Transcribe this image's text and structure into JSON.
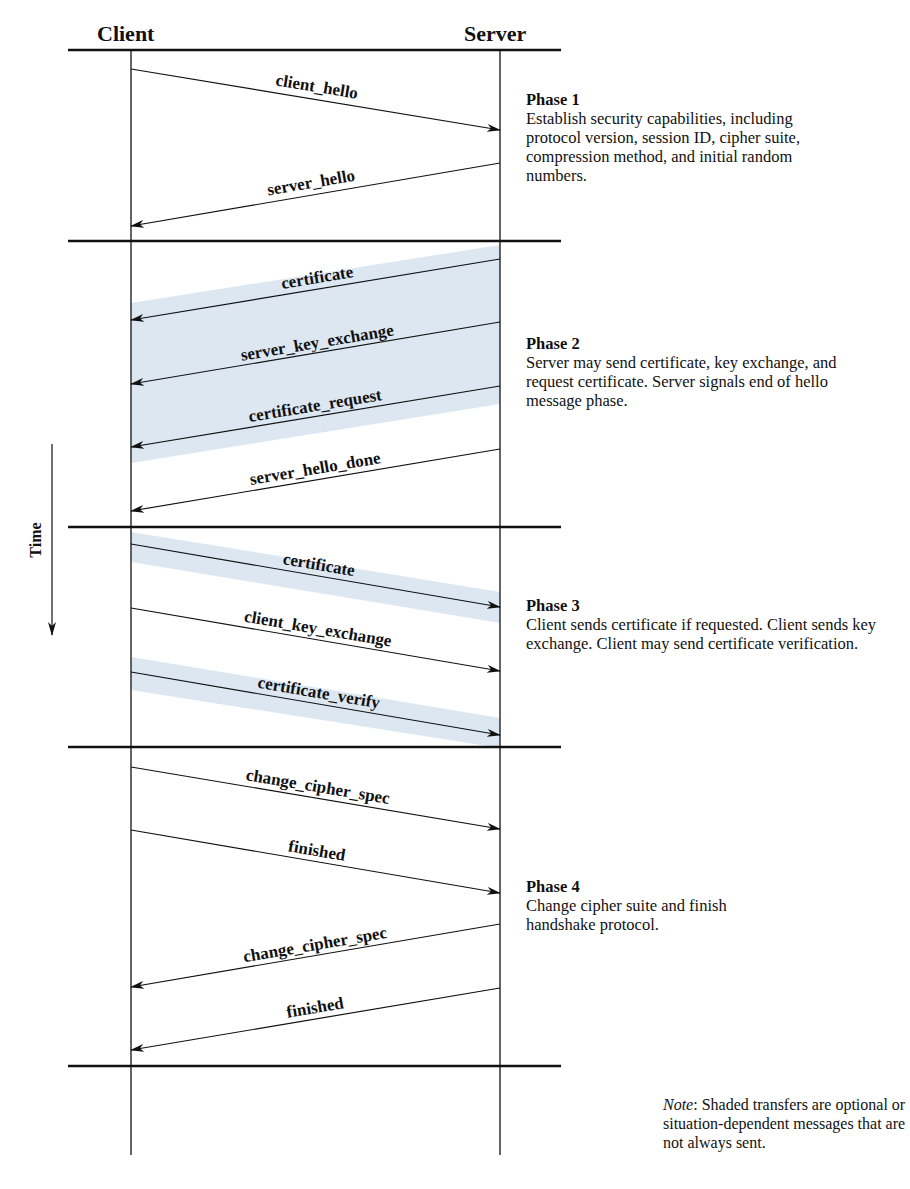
{
  "diagram": {
    "parties": {
      "client": "Client",
      "server": "Server"
    },
    "time_label": "Time",
    "colors": {
      "line": "#111111",
      "shade": "#dce7f2",
      "background": "#ffffff"
    },
    "phases": [
      {
        "title": "Phase 1",
        "description": "Establish security capabilities, including protocol version, session ID, cipher suite, compression method, and initial random numbers.",
        "messages": [
          {
            "label": "client_hello",
            "direction": "client-to-server",
            "optional": false
          },
          {
            "label": "server_hello",
            "direction": "server-to-client",
            "optional": false
          }
        ]
      },
      {
        "title": "Phase 2",
        "description": "Server may send certificate, key exchange, and request certificate. Server signals end of hello message phase.",
        "messages": [
          {
            "label": "certificate",
            "direction": "server-to-client",
            "optional": true
          },
          {
            "label": "server_key_exchange",
            "direction": "server-to-client",
            "optional": true
          },
          {
            "label": "certificate_request",
            "direction": "server-to-client",
            "optional": true
          },
          {
            "label": "server_hello_done",
            "direction": "server-to-client",
            "optional": false
          }
        ]
      },
      {
        "title": "Phase 3",
        "description": "Client sends certificate if requested. Client sends key exchange. Client may send certificate verification.",
        "messages": [
          {
            "label": "certificate",
            "direction": "client-to-server",
            "optional": true
          },
          {
            "label": "client_key_exchange",
            "direction": "client-to-server",
            "optional": false
          },
          {
            "label": "certificate_verify",
            "direction": "client-to-server",
            "optional": true
          }
        ]
      },
      {
        "title": "Phase 4",
        "description": "Change cipher suite and finish handshake protocol.",
        "messages": [
          {
            "label": "change_cipher_spec",
            "direction": "client-to-server",
            "optional": false
          },
          {
            "label": "finished",
            "direction": "client-to-server",
            "optional": false
          },
          {
            "label": "change_cipher_spec",
            "direction": "server-to-client",
            "optional": false
          },
          {
            "label": "finished",
            "direction": "server-to-client",
            "optional": false
          }
        ]
      }
    ],
    "note": {
      "prefix": "Note",
      "text": ": Shaded transfers are optional or situation-dependent messages that are not always sent."
    }
  }
}
